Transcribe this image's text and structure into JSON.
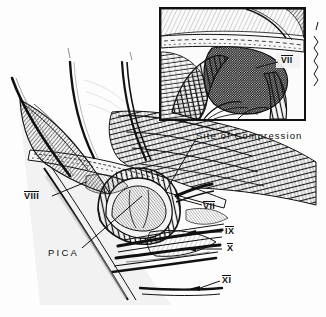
{
  "figure": {
    "medium": "pen-and-ink stipple and hatch line drawing",
    "background_color": "#fdfdfd",
    "ink_color": "#111111",
    "width": 326,
    "height": 317
  },
  "labels": {
    "site_of_compression": "Site of Compression",
    "nerve_vii_main": "VII",
    "nerve_vii_inset": "VII",
    "nerve_viii": "VIII",
    "nerve_ix": "IX",
    "nerve_x": "X",
    "nerve_xi": "XI",
    "pica": "PICA"
  },
  "inset": {
    "name": "magnified-detail-panel",
    "border_color": "#111111",
    "x": 160,
    "y": 8,
    "width": 145,
    "height": 112
  },
  "structures": [
    {
      "name": "retractor-blade-left",
      "type": "instrument"
    },
    {
      "name": "retractor-blade-center",
      "type": "instrument"
    },
    {
      "name": "retractor-blade-right",
      "type": "instrument"
    },
    {
      "name": "cerebellum-folia",
      "type": "tissue"
    },
    {
      "name": "petrous-dura",
      "type": "tissue"
    },
    {
      "name": "pica-vascular-loop",
      "type": "vessel"
    },
    {
      "name": "lower-cranial-nerve-rootlets",
      "type": "nerve"
    },
    {
      "name": "brainstem-surface",
      "type": "tissue"
    }
  ]
}
